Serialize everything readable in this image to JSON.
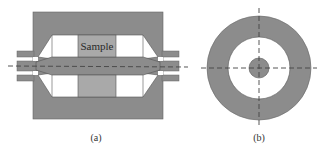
{
  "figure": {
    "panel_a": {
      "label": "(a)",
      "sample_label": "Sample"
    },
    "panel_b": {
      "label": "(b)"
    }
  },
  "colors": {
    "dark_gray": "#8c8c8c",
    "sample_gray": "#a9a9a9",
    "white": "#ffffff",
    "outline": "#555555",
    "axis_line": "#444444"
  }
}
